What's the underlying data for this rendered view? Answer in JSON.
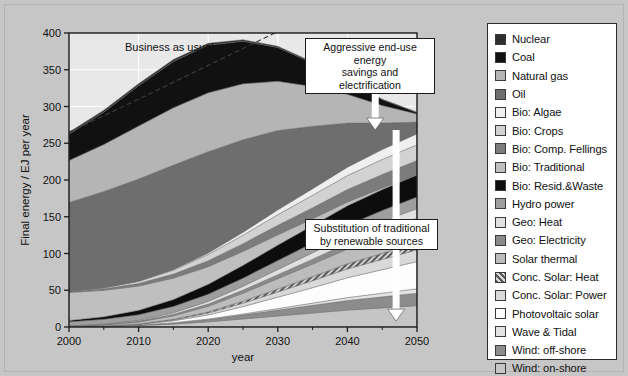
{
  "chart_data": {
    "type": "area",
    "title": "",
    "xlabel": "year",
    "ylabel": "Final energy / EJ per year",
    "xlim": [
      2000,
      2050
    ],
    "ylim": [
      0,
      400
    ],
    "xticks": [
      2000,
      2010,
      2020,
      2030,
      2040,
      2050
    ],
    "yticks": [
      0,
      50,
      100,
      150,
      200,
      250,
      300,
      350,
      400
    ],
    "grid": true,
    "legend_position": "right-outside",
    "x": [
      2000,
      2005,
      2010,
      2015,
      2020,
      2025,
      2030,
      2035,
      2040,
      2045,
      2050
    ],
    "series": [
      {
        "name": "Wind: on-shore",
        "color": "#c5c5c5",
        "values": [
          0.3,
          0.8,
          2.0,
          4.0,
          7.0,
          11.0,
          15.0,
          19.0,
          23.0,
          26.0,
          29.0
        ]
      },
      {
        "name": "Wind: off-shore",
        "color": "#8c8c8c",
        "values": [
          0.0,
          0.2,
          0.6,
          1.6,
          3.2,
          5.5,
          8.0,
          10.5,
          13.0,
          15.0,
          17.0
        ]
      },
      {
        "name": "Wave & Tidal",
        "color": "#e3e3e3",
        "values": [
          0.0,
          0.0,
          0.1,
          0.3,
          0.7,
          1.3,
          2.1,
          3.0,
          4.0,
          5.0,
          6.0
        ]
      },
      {
        "name": "Photovoltaic solar",
        "color": "#fdfdfd",
        "values": [
          0.0,
          0.2,
          0.8,
          2.5,
          5.5,
          10.0,
          15.5,
          21.0,
          27.0,
          32.0,
          37.0
        ]
      },
      {
        "name": "Conc. Solar: Power",
        "color": "#d9d9d9",
        "values": [
          0.0,
          0.1,
          0.4,
          1.2,
          2.6,
          4.6,
          7.0,
          9.5,
          12.0,
          14.0,
          16.0
        ]
      },
      {
        "name": "Conc. Solar: Heat",
        "color": "#9a9a9a",
        "values": [
          0.0,
          0.1,
          0.3,
          0.8,
          1.6,
          2.8,
          4.2,
          5.6,
          7.0,
          8.2,
          9.0
        ]
      },
      {
        "name": "Solar thermal",
        "color": "#bcbcbc",
        "values": [
          0.5,
          1.2,
          2.6,
          4.8,
          7.6,
          10.8,
          14.0,
          17.0,
          20.0,
          22.5,
          24.5
        ]
      },
      {
        "name": "Geo: Electricity",
        "color": "#8a8a8a",
        "values": [
          0.4,
          0.7,
          1.2,
          2.0,
          3.0,
          4.2,
          5.4,
          6.6,
          7.8,
          8.8,
          9.6
        ]
      },
      {
        "name": "Geo: Heat",
        "color": "#e0e0e0",
        "values": [
          0.3,
          0.6,
          1.2,
          2.2,
          3.6,
          5.2,
          7.0,
          8.8,
          10.5,
          12.0,
          13.0
        ]
      },
      {
        "name": "Hydro power",
        "color": "#9e9e9e",
        "values": [
          5.5,
          6.5,
          7.5,
          8.6,
          9.8,
          11.0,
          12.2,
          13.2,
          14.2,
          15.0,
          15.8
        ]
      },
      {
        "name": "Bio: Resid.&Waste",
        "color": "#0d0d0d",
        "values": [
          2.0,
          3.5,
          6.0,
          9.5,
          13.5,
          17.5,
          21.0,
          24.0,
          26.5,
          28.5,
          30.0
        ]
      },
      {
        "name": "Bio: Traditional",
        "color": "#bfbfbf",
        "values": [
          38.0,
          36.0,
          33.0,
          29.0,
          24.0,
          19.0,
          14.0,
          9.0,
          5.0,
          2.0,
          0.0
        ]
      },
      {
        "name": "Bio: Comp. Fellings",
        "color": "#7c7c7c",
        "values": [
          1.0,
          2.0,
          3.5,
          5.5,
          8.0,
          10.5,
          13.0,
          15.0,
          17.0,
          18.5,
          19.5
        ]
      },
      {
        "name": "Bio: Crops",
        "color": "#d2d2d2",
        "values": [
          0.5,
          1.5,
          3.0,
          5.5,
          8.5,
          11.5,
          14.5,
          17.0,
          19.0,
          20.5,
          21.5
        ]
      },
      {
        "name": "Bio: Algae",
        "color": "#efefef",
        "values": [
          0.0,
          0.0,
          0.2,
          0.8,
          2.0,
          4.0,
          6.5,
          9.0,
          11.5,
          13.5,
          15.0
        ]
      },
      {
        "name": "Oil",
        "color": "#6e6e6e",
        "values": [
          121.0,
          131.0,
          139.0,
          142.0,
          138.0,
          126.0,
          108.0,
          85.0,
          60.0,
          36.0,
          16.0
        ]
      },
      {
        "name": "Natural gas",
        "color": "#b5b5b5",
        "values": [
          57.0,
          64.0,
          72.0,
          78.0,
          80.0,
          76.0,
          67.0,
          54.0,
          39.0,
          24.0,
          11.0
        ]
      },
      {
        "name": "Coal",
        "color": "#111111",
        "values": [
          36.0,
          44.0,
          55.0,
          63.0,
          65.0,
          58.0,
          46.0,
          32.0,
          19.0,
          8.0,
          2.0
        ]
      },
      {
        "name": "Nuclear",
        "color": "#2e2e2e",
        "values": [
          2.5,
          2.6,
          2.7,
          2.6,
          2.4,
          2.0,
          1.6,
          1.2,
          0.8,
          0.4,
          0.2
        ]
      }
    ],
    "business_as_usual": {
      "label": "Business as usual",
      "x": [
        2000,
        2010,
        2020,
        2030,
        2040,
        2050
      ],
      "y": [
        265.0,
        310.0,
        356.0,
        402.0,
        448.0,
        494.0
      ],
      "style": "dashed"
    },
    "annotations": [
      {
        "id": "bau",
        "text": "Business as usual"
      },
      {
        "id": "agg",
        "line1": "Aggressive end-use energy",
        "line2": "savings and electrification"
      },
      {
        "id": "sub",
        "line1": "Substitution of traditional",
        "line2": "by renewable sources"
      }
    ],
    "arrows": [
      {
        "name": "aggressive-savings-arrow",
        "x": 2044,
        "y_from": 390,
        "y_to": 268
      },
      {
        "name": "renewable-substitution-arrow",
        "x": 2047,
        "y_from": 268,
        "y_to": 8
      }
    ]
  },
  "legend": {
    "items": [
      {
        "label": "Nuclear",
        "color": "#2e2e2e",
        "pattern": "solid"
      },
      {
        "label": "Coal",
        "color": "#111111",
        "pattern": "solid"
      },
      {
        "label": "Natural gas",
        "color": "#b5b5b5",
        "pattern": "solid"
      },
      {
        "label": "Oil",
        "color": "#6e6e6e",
        "pattern": "solid"
      },
      {
        "label": "Bio: Algae",
        "color": "#efefef",
        "pattern": "solid"
      },
      {
        "label": "Bio: Crops",
        "color": "#d2d2d2",
        "pattern": "solid"
      },
      {
        "label": "Bio: Comp. Fellings",
        "color": "#7c7c7c",
        "pattern": "solid"
      },
      {
        "label": "Bio: Traditional",
        "color": "#bfbfbf",
        "pattern": "solid"
      },
      {
        "label": "Bio: Resid.&Waste",
        "color": "#0d0d0d",
        "pattern": "solid"
      },
      {
        "label": "Hydro power",
        "color": "#9e9e9e",
        "pattern": "solid"
      },
      {
        "label": "Geo: Heat",
        "color": "#e0e0e0",
        "pattern": "solid"
      },
      {
        "label": "Geo: Electricity",
        "color": "#8a8a8a",
        "pattern": "solid"
      },
      {
        "label": "Solar thermal",
        "color": "#bcbcbc",
        "pattern": "solid"
      },
      {
        "label": "Conc. Solar: Heat",
        "color": "#9a9a9a",
        "pattern": "hatch"
      },
      {
        "label": "Conc. Solar: Power",
        "color": "#d9d9d9",
        "pattern": "solid"
      },
      {
        "label": "Photovoltaic solar",
        "color": "#fdfdfd",
        "pattern": "solid"
      },
      {
        "label": "Wave & Tidal",
        "color": "#e3e3e3",
        "pattern": "solid"
      },
      {
        "label": "Wind: off-shore",
        "color": "#8c8c8c",
        "pattern": "solid"
      },
      {
        "label": "Wind: on-shore",
        "color": "#c5c5c5",
        "pattern": "solid"
      }
    ]
  },
  "colors": {
    "background": "#c6c6c6",
    "plot_background": "#e8e8e8",
    "grid": "#ffffff",
    "axis": "#1c1c1c",
    "arrow_fill": "#ffffff"
  }
}
